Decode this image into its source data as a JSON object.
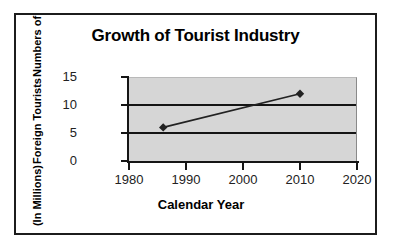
{
  "chart_data": {
    "type": "line",
    "title": "Growth of Tourist Industry",
    "xlabel": "Calendar Year",
    "ylabel": "Numbers of Foreign Tourists (In Millions)",
    "ylabel_lines": [
      "Numbers of",
      "Foreign Tourists",
      "(In Millions)"
    ],
    "xlim": [
      1980,
      2020
    ],
    "ylim": [
      0,
      15
    ],
    "xticks": [
      1980,
      1990,
      2000,
      2010,
      2020
    ],
    "xtick_labels": [
      "1980",
      "1990",
      "2000",
      "2010",
      "2020"
    ],
    "yticks": [
      0,
      5,
      10,
      15
    ],
    "ytick_labels": [
      "0",
      "5",
      "10",
      "15"
    ],
    "grid": "horizontal",
    "legend": "none",
    "plot_background": "#d6d6d6",
    "series": [
      {
        "name": "Foreign Tourists",
        "marker": "diamond",
        "color": "#222222",
        "x": [
          1986,
          2010
        ],
        "values": [
          6,
          12
        ],
        "points": [
          {
            "x": 1986,
            "y": 6
          },
          {
            "x": 2010,
            "y": 12
          }
        ]
      }
    ]
  },
  "frame": {
    "border_color": "#1c1c1c"
  }
}
